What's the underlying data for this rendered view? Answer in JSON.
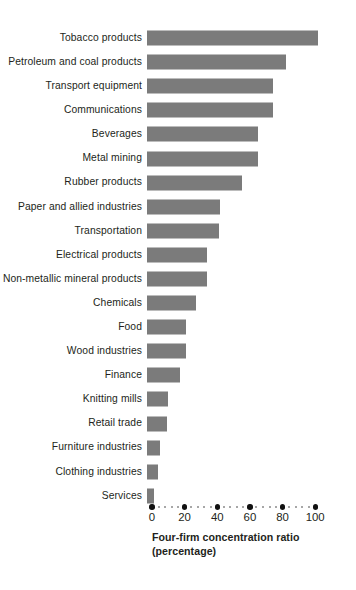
{
  "chart_data": {
    "type": "bar",
    "orientation": "horizontal",
    "title": "",
    "xlabel": "Four-firm concentration ratio (percentage)",
    "ylabel": "",
    "xlim": [
      0,
      110
    ],
    "grid": false,
    "legend": null,
    "bar_color": "#7b7b7b",
    "axis_title_lines": [
      "Four-firm concentration ratio",
      "(percentage)"
    ],
    "xticks": [
      0,
      20,
      40,
      60,
      80,
      100
    ],
    "xtick_labels": [
      "0",
      "20",
      "40",
      "60",
      "80",
      "100"
    ],
    "categories": [
      "Tobacco products",
      "Petroleum and coal products",
      "Transport equipment",
      "Communications",
      "Beverages",
      "Metal mining",
      "Rubber products",
      "Paper and allied industries",
      "Transportation",
      "Electrical products",
      "Non-metallic mineral products",
      "Chemicals",
      "Food",
      "Wood industries",
      "Finance",
      "Knitting mills",
      "Retail trade",
      "Furniture industries",
      "Clothing industries",
      "Services"
    ],
    "values": [
      105,
      85,
      77,
      77,
      68,
      68,
      58,
      45,
      44,
      37,
      37,
      30,
      24,
      24,
      20,
      13,
      12,
      8,
      7,
      4
    ]
  }
}
